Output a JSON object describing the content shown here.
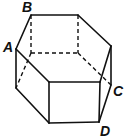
{
  "figure": {
    "type": "hexagonal prism",
    "labels": {
      "A": "A",
      "B": "B",
      "C": "C",
      "D": "D"
    },
    "line_color": "#111111",
    "solid_edges": [
      [
        [
          31,
          15
        ],
        [
          78,
          15
        ]
      ],
      [
        [
          78,
          15
        ],
        [
          111,
          46
        ]
      ],
      [
        [
          111,
          46
        ],
        [
          100,
          82
        ]
      ],
      [
        [
          100,
          82
        ],
        [
          49,
          82
        ]
      ],
      [
        [
          49,
          82
        ],
        [
          16,
          49
        ]
      ],
      [
        [
          16,
          49
        ],
        [
          31,
          15
        ]
      ],
      [
        [
          16,
          49
        ],
        [
          16,
          88
        ]
      ],
      [
        [
          49,
          82
        ],
        [
          49,
          123
        ]
      ],
      [
        [
          100,
          82
        ],
        [
          99,
          122
        ]
      ],
      [
        [
          111,
          46
        ],
        [
          111,
          85
        ]
      ],
      [
        [
          16,
          88
        ],
        [
          49,
          123
        ]
      ],
      [
        [
          49,
          123
        ],
        [
          99,
          122
        ]
      ],
      [
        [
          99,
          122
        ],
        [
          111,
          85
        ]
      ]
    ],
    "dashed_edges": [
      [
        [
          31,
          15
        ],
        [
          31,
          53
        ]
      ],
      [
        [
          78,
          15
        ],
        [
          78,
          53
        ]
      ],
      [
        [
          31,
          53
        ],
        [
          78,
          53
        ]
      ],
      [
        [
          78,
          53
        ],
        [
          111,
          85
        ]
      ],
      [
        [
          31,
          53
        ],
        [
          16,
          88
        ]
      ]
    ]
  }
}
